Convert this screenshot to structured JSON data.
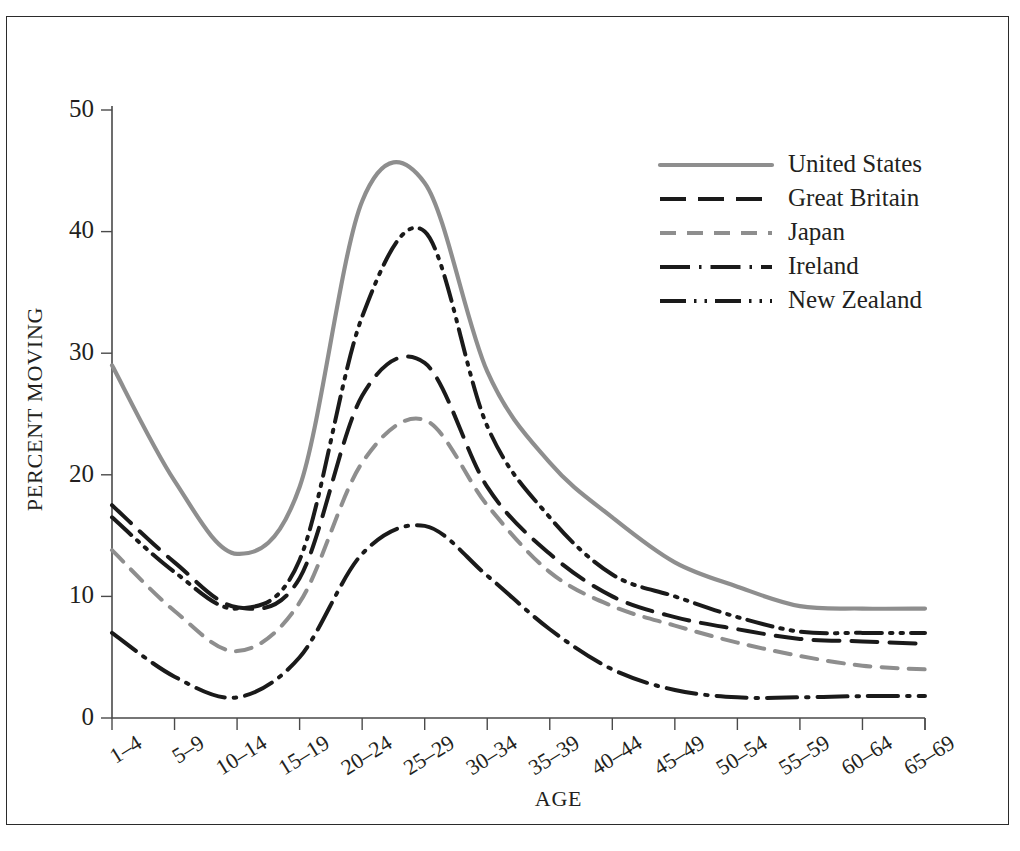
{
  "chart_data": {
    "type": "line",
    "title": "",
    "xlabel": "AGE",
    "ylabel": "PERCENT MOVING",
    "ylim": [
      0,
      50
    ],
    "yticks": [
      0,
      10,
      20,
      30,
      40,
      50
    ],
    "ytick_labels": [
      "0",
      "10",
      "20",
      "30",
      "40",
      "50"
    ],
    "grid": false,
    "legend_position": "top-right",
    "categories": [
      "1–4",
      "5–9",
      "10–14",
      "15–19",
      "20–24",
      "25–29",
      "30–34",
      "35–39",
      "40–44",
      "45–49",
      "50–54",
      "55–59",
      "60–64",
      "65–69"
    ],
    "series": [
      {
        "name": "United States",
        "color": "#8e8e8e",
        "dash": "solid",
        "values": [
          29.0,
          19.5,
          13.5,
          19.0,
          42.5,
          44.0,
          28.5,
          21.0,
          16.5,
          12.8,
          10.8,
          9.2,
          9.0,
          9.0
        ]
      },
      {
        "name": "Great Britain",
        "color": "#1a1a1a",
        "dash": "long-dash",
        "values": [
          17.5,
          12.8,
          9.1,
          11.5,
          26.5,
          29.2,
          19.0,
          13.5,
          10.0,
          8.3,
          7.3,
          6.5,
          6.3,
          6.1
        ]
      },
      {
        "name": "Japan",
        "color": "#8e8e8e",
        "dash": "dash",
        "values": [
          13.8,
          8.8,
          5.5,
          9.5,
          21.0,
          24.5,
          17.5,
          12.0,
          9.2,
          7.6,
          6.2,
          5.1,
          4.3,
          4.0
        ]
      },
      {
        "name": "Ireland",
        "color": "#1a1a1a",
        "dash": "dash-dot",
        "values": [
          7.0,
          3.4,
          1.7,
          5.0,
          13.5,
          15.8,
          11.7,
          7.3,
          4.0,
          2.3,
          1.7,
          1.7,
          1.8,
          1.8
        ]
      },
      {
        "name": "New Zealand",
        "color": "#1a1a1a",
        "dash": "dash-dot-dot",
        "values": [
          16.5,
          12.0,
          9.0,
          13.0,
          33.0,
          40.0,
          24.0,
          16.5,
          11.8,
          10.0,
          8.3,
          7.1,
          7.0,
          7.0
        ]
      }
    ],
    "peaks": {
      "United States": 45.3,
      "New Zealand": 40.0,
      "Great Britain": 29.3,
      "Japan": 24.6,
      "Ireland": 15.8
    }
  },
  "legend": {
    "entries": [
      {
        "label": "United States"
      },
      {
        "label": "Great Britain"
      },
      {
        "label": "Japan"
      },
      {
        "label": "Ireland"
      },
      {
        "label": "New Zealand"
      }
    ]
  },
  "axes": {
    "x_title": "AGE",
    "y_title": "PERCENT MOVING"
  }
}
